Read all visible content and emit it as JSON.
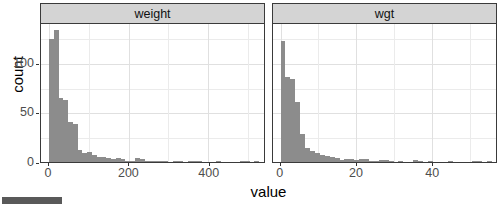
{
  "chart_data": {
    "type": "bar",
    "title": "",
    "subtitle": "",
    "xlabel": "value",
    "ylabel": "count",
    "grid": true,
    "legend": null,
    "facet_variable": "variable",
    "shared_y_axis": true,
    "y_ticks": [
      0,
      50,
      100
    ],
    "ylim": [
      0,
      140
    ],
    "panels": [
      {
        "label": "weight",
        "x_ticks": [
          0,
          200,
          400
        ],
        "xlim": [
          -20,
          540
        ],
        "bin_width": 12,
        "bins": [
          {
            "x": 0,
            "count": 124
          },
          {
            "x": 12,
            "count": 133
          },
          {
            "x": 24,
            "count": 64
          },
          {
            "x": 36,
            "count": 62
          },
          {
            "x": 48,
            "count": 40
          },
          {
            "x": 60,
            "count": 38
          },
          {
            "x": 72,
            "count": 12
          },
          {
            "x": 84,
            "count": 9
          },
          {
            "x": 96,
            "count": 10
          },
          {
            "x": 108,
            "count": 7
          },
          {
            "x": 120,
            "count": 5
          },
          {
            "x": 132,
            "count": 5
          },
          {
            "x": 144,
            "count": 4
          },
          {
            "x": 156,
            "count": 3
          },
          {
            "x": 168,
            "count": 4
          },
          {
            "x": 180,
            "count": 3
          },
          {
            "x": 192,
            "count": 1
          },
          {
            "x": 204,
            "count": 1
          },
          {
            "x": 216,
            "count": 4
          },
          {
            "x": 228,
            "count": 3
          },
          {
            "x": 240,
            "count": 1
          },
          {
            "x": 252,
            "count": 1
          },
          {
            "x": 264,
            "count": 1
          },
          {
            "x": 276,
            "count": 1
          },
          {
            "x": 288,
            "count": 1
          },
          {
            "x": 300,
            "count": 0
          },
          {
            "x": 312,
            "count": 1
          },
          {
            "x": 324,
            "count": 1
          },
          {
            "x": 336,
            "count": 0
          },
          {
            "x": 348,
            "count": 1
          },
          {
            "x": 360,
            "count": 1
          },
          {
            "x": 372,
            "count": 1
          },
          {
            "x": 384,
            "count": 0
          },
          {
            "x": 396,
            "count": 0
          },
          {
            "x": 408,
            "count": 0
          },
          {
            "x": 420,
            "count": 1
          },
          {
            "x": 432,
            "count": 0
          },
          {
            "x": 444,
            "count": 0
          },
          {
            "x": 456,
            "count": 0
          },
          {
            "x": 468,
            "count": 0
          },
          {
            "x": 480,
            "count": 1
          },
          {
            "x": 492,
            "count": 1
          },
          {
            "x": 504,
            "count": 0
          },
          {
            "x": 516,
            "count": 1
          }
        ]
      },
      {
        "label": "wgt",
        "x_ticks": [
          0,
          20,
          40
        ],
        "xlim": [
          -2,
          57
        ],
        "bin_width": 1.3,
        "bins": [
          {
            "x": 0,
            "count": 122
          },
          {
            "x": 1.3,
            "count": 86
          },
          {
            "x": 2.6,
            "count": 84
          },
          {
            "x": 3.9,
            "count": 60
          },
          {
            "x": 5.2,
            "count": 28
          },
          {
            "x": 6.5,
            "count": 14
          },
          {
            "x": 7.8,
            "count": 11
          },
          {
            "x": 9.1,
            "count": 9
          },
          {
            "x": 10.4,
            "count": 7
          },
          {
            "x": 11.7,
            "count": 6
          },
          {
            "x": 13.0,
            "count": 5
          },
          {
            "x": 14.3,
            "count": 4
          },
          {
            "x": 15.6,
            "count": 2
          },
          {
            "x": 16.9,
            "count": 3
          },
          {
            "x": 18.2,
            "count": 3
          },
          {
            "x": 19.5,
            "count": 2
          },
          {
            "x": 20.8,
            "count": 3
          },
          {
            "x": 22.1,
            "count": 3
          },
          {
            "x": 23.4,
            "count": 1
          },
          {
            "x": 24.7,
            "count": 1
          },
          {
            "x": 26.0,
            "count": 2
          },
          {
            "x": 27.3,
            "count": 2
          },
          {
            "x": 28.6,
            "count": 1
          },
          {
            "x": 29.9,
            "count": 0
          },
          {
            "x": 31.2,
            "count": 1
          },
          {
            "x": 32.5,
            "count": 0
          },
          {
            "x": 33.8,
            "count": 0
          },
          {
            "x": 35.1,
            "count": 2
          },
          {
            "x": 36.4,
            "count": 1
          },
          {
            "x": 37.7,
            "count": 0
          },
          {
            "x": 39.0,
            "count": 1
          },
          {
            "x": 40.3,
            "count": 0
          },
          {
            "x": 41.6,
            "count": 0
          },
          {
            "x": 42.9,
            "count": 0
          },
          {
            "x": 44.2,
            "count": 1
          },
          {
            "x": 45.5,
            "count": 0
          },
          {
            "x": 46.8,
            "count": 0
          },
          {
            "x": 48.1,
            "count": 0
          },
          {
            "x": 49.4,
            "count": 0
          },
          {
            "x": 50.7,
            "count": 1
          },
          {
            "x": 52.0,
            "count": 1
          },
          {
            "x": 53.3,
            "count": 0
          },
          {
            "x": 54.6,
            "count": 1
          }
        ]
      }
    ]
  },
  "style": {
    "bar_color": "#8c8c8c",
    "strip_background": "#d4d4d4",
    "panel_border": "#3a3a3a",
    "gridline_color": "#ebebeb",
    "tick_label_color": "#4d4d4d",
    "axis_title_color": "#000000",
    "bottom_bar_color": "#595959"
  }
}
